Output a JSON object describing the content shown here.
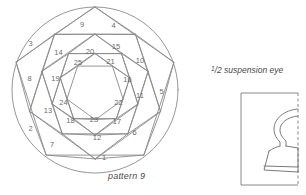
{
  "figure": {
    "caption": "pattern 9",
    "type": "nested-rotated-pentagons",
    "region_count": 25,
    "ring_count": 5,
    "outer_shape": "circle",
    "line_color": "#8a8a8a",
    "label_color": "#6b6b6b",
    "background": "#ffffff"
  },
  "regions": [
    {
      "id": 1,
      "label": "1",
      "x": 104.0,
      "y": 158.5
    },
    {
      "id": 2,
      "label": "2",
      "x": 30.5,
      "y": 129.5
    },
    {
      "id": 3,
      "label": "3",
      "x": 30.5,
      "y": 44.0
    },
    {
      "id": 4,
      "label": "4",
      "x": 113.5,
      "y": 26.5
    },
    {
      "id": 5,
      "label": "5",
      "x": 161.5,
      "y": 92.5
    },
    {
      "id": 6,
      "label": "6",
      "x": 134.5,
      "y": 133.0
    },
    {
      "id": 7,
      "label": "7",
      "x": 52.0,
      "y": 145.5
    },
    {
      "id": 8,
      "label": "8",
      "x": 29.5,
      "y": 79.5
    },
    {
      "id": 9,
      "label": "9",
      "x": 82.0,
      "y": 25.5
    },
    {
      "id": 10,
      "label": "10",
      "x": 140.0,
      "y": 61.5
    },
    {
      "id": 11,
      "label": "11",
      "x": 140.0,
      "y": 96.0
    },
    {
      "id": 12,
      "label": "12",
      "x": 97.0,
      "y": 138.0
    },
    {
      "id": 13,
      "label": "13",
      "x": 48.0,
      "y": 111.5
    },
    {
      "id": 14,
      "label": "14",
      "x": 58.5,
      "y": 53.0
    },
    {
      "id": 15,
      "label": "15",
      "x": 116.0,
      "y": 47.5
    },
    {
      "id": 16,
      "label": "16",
      "x": 127.5,
      "y": 80.5
    },
    {
      "id": 17,
      "label": "17",
      "x": 117.0,
      "y": 122.5
    },
    {
      "id": 18,
      "label": "18",
      "x": 70.5,
      "y": 121.0
    },
    {
      "id": 19,
      "label": "19",
      "x": 55.5,
      "y": 79.5
    },
    {
      "id": 20,
      "label": "20",
      "x": 90.0,
      "y": 52.5
    },
    {
      "id": 21,
      "label": "21",
      "x": 110.5,
      "y": 62.5
    },
    {
      "id": 22,
      "label": "22",
      "x": 118.5,
      "y": 103.5
    },
    {
      "id": 23,
      "label": "23",
      "x": 94.0,
      "y": 120.5
    },
    {
      "id": 24,
      "label": "24",
      "x": 63.5,
      "y": 103.0
    },
    {
      "id": 25,
      "label": "25",
      "x": 78.0,
      "y": 63.5
    }
  ],
  "suspension_eye": {
    "title_numerator": "1",
    "title_denominator": "2",
    "title_text": "suspension eye",
    "full_title": "1/2 suspension eye",
    "box_right_edge_style": "dashed"
  }
}
